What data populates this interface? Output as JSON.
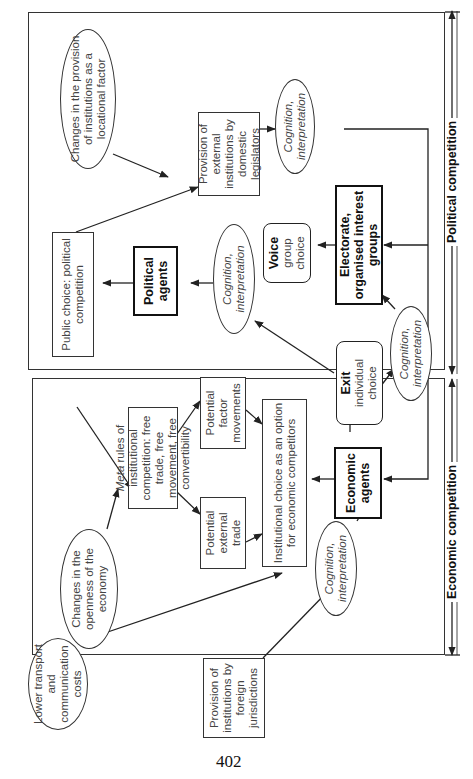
{
  "page_number": "402",
  "sections": {
    "political": {
      "label": "Political competition"
    },
    "economic": {
      "label": "Economic competition"
    }
  },
  "nodes": {
    "lower_costs": "Lower transport and communication costs",
    "openness": "Changes in the openness of the economy",
    "locational": "Changes in the provision of institutions as a locational factor",
    "public_choice": "Public choice: political competition",
    "meta_rules": {
      "italic": "Meta",
      "text": " rules of institutional competition: free trade, free movement, free convertibility"
    },
    "external_trade": "Potential external trade",
    "factor_movements": "Potential factor movements",
    "institutional_choice": "Institutional choice as an option for economic competitors",
    "economic_agents": "Economic agents",
    "political_agents": "Political agents",
    "exit": {
      "title": "Exit",
      "sub": "individual choice"
    },
    "voice": {
      "title": "Voice",
      "sub": "group choice"
    },
    "electorate": "Electorate, organised interest groups",
    "domestic_provision": "Provision of external institutions by domestic legislators",
    "foreign_provision": "Provision of institutions by foreign jurisdictions",
    "cognition_economic": "Cognition, interpretation",
    "cognition_political": "Cognition, interpretation",
    "cognition_exit": "Cognition, interpretation",
    "cognition_domestic": "Cognition, interpretation"
  },
  "colors": {
    "line": "#222222",
    "background": "#ffffff"
  }
}
